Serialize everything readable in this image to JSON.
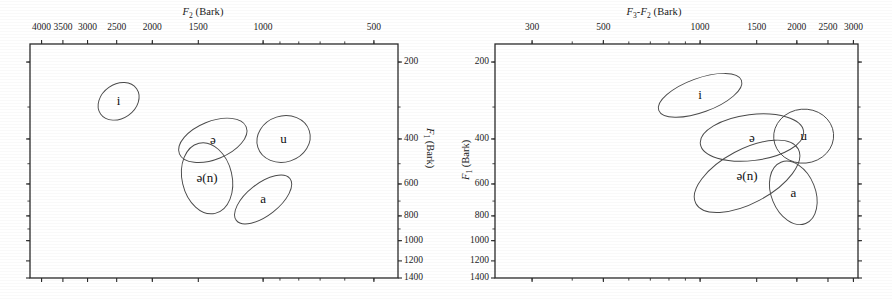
{
  "figure": {
    "panels": [
      {
        "id": "left",
        "xaxis": {
          "title_html": "F2 (Bark)",
          "label": "F2 (Bark)",
          "symbol": "F",
          "sub": "2",
          "unit": "(Bark)",
          "ticks": [
            4000,
            3500,
            3000,
            2500,
            2000,
            1500,
            1000,
            500
          ],
          "tick_labels": [
            "4000",
            "3500",
            "3000",
            "2500",
            "2000",
            "1500",
            "1000",
            "500"
          ],
          "scale": "log",
          "direction": "decreasing",
          "range": [
            4300,
            430
          ],
          "position": "top"
        },
        "yaxis": {
          "label": "F1 (Bark)",
          "symbol": "F",
          "sub": "1",
          "unit": "(Bark)",
          "ticks": [
            200,
            400,
            600,
            800,
            1000,
            1200,
            1400
          ],
          "tick_labels": [
            "200",
            "400",
            "600",
            "800",
            "1000",
            "1200",
            "1400"
          ],
          "scale": "log",
          "direction": "increasing-downward",
          "range": [
            170,
            1400
          ],
          "position": "right"
        }
      },
      {
        "id": "right",
        "xaxis": {
          "label": "F3-F2 (Bark)",
          "symbol": "F",
          "sub": "3",
          "sub2": "2",
          "unit": "(Bark)",
          "ticks": [
            300,
            500,
            1000,
            1500,
            2000,
            2500,
            3000
          ],
          "tick_labels": [
            "300",
            "500",
            "1000",
            "1500",
            "2000",
            "2500",
            "3000"
          ],
          "scale": "log",
          "direction": "increasing",
          "range": [
            230,
            3100
          ],
          "position": "top"
        },
        "yaxis": {
          "label": "F1 (Bark)",
          "symbol": "F",
          "sub": "1",
          "unit": "(Bark)",
          "ticks": [
            200,
            400,
            600,
            800,
            1000,
            1200,
            1400
          ],
          "tick_labels": [
            "200",
            "400",
            "600",
            "800",
            "1000",
            "1200",
            "1400"
          ],
          "scale": "log",
          "direction": "increasing-downward",
          "range": [
            170,
            1400
          ],
          "position": "left"
        }
      }
    ]
  },
  "chart_data": [
    {
      "type": "scatter",
      "id": "left-vowel-space",
      "title": "",
      "xlabel": "F2 (Bark)",
      "ylabel": "F1 (Bark)",
      "xlim": [
        4300,
        430
      ],
      "ylim": [
        170,
        1400
      ],
      "xscale": "log",
      "yscale": "log",
      "x_axis_position": "top",
      "y_axis_position": "right",
      "grid": false,
      "legend": "none",
      "marker": "ellipse-outline",
      "series": [
        {
          "name": "i",
          "label": "i",
          "cx": 2470,
          "cy": 285,
          "rx_px": 22,
          "ry_px": 17,
          "angle_deg": -35
        },
        {
          "name": "e",
          "label": "ə",
          "cx": 1370,
          "cy": 405,
          "rx_px": 36,
          "ry_px": 19,
          "angle_deg": -22
        },
        {
          "name": "u",
          "label": "u",
          "cx": 880,
          "cy": 400,
          "rx_px": 27,
          "ry_px": 23,
          "angle_deg": -18
        },
        {
          "name": "en",
          "label": "ə(n)",
          "cx": 1420,
          "cy": 570,
          "rx_px": 25,
          "ry_px": 36,
          "angle_deg": -13
        },
        {
          "name": "a",
          "label": "a",
          "cx": 1000,
          "cy": 690,
          "rx_px": 34,
          "ry_px": 16,
          "angle_deg": -38
        }
      ]
    },
    {
      "type": "scatter",
      "id": "right-vowel-space",
      "title": "",
      "xlabel": "F3-F2 (Bark)",
      "ylabel": "F1 (Bark)",
      "xlim": [
        230,
        3100
      ],
      "ylim": [
        170,
        1400
      ],
      "xscale": "log",
      "yscale": "log",
      "x_axis_position": "top",
      "y_axis_position": "left",
      "grid": false,
      "legend": "none",
      "marker": "ellipse-outline",
      "series": [
        {
          "name": "i",
          "label": "i",
          "cx": 1000,
          "cy": 270,
          "rx_px": 44,
          "ry_px": 17,
          "angle_deg": -20
        },
        {
          "name": "e",
          "label": "ə",
          "cx": 1450,
          "cy": 395,
          "rx_px": 52,
          "ry_px": 23,
          "angle_deg": -7
        },
        {
          "name": "u",
          "label": "u",
          "cx": 2100,
          "cy": 390,
          "rx_px": 30,
          "ry_px": 27,
          "angle_deg": -5
        },
        {
          "name": "en",
          "label": "ə(n)",
          "cx": 1400,
          "cy": 560,
          "rx_px": 58,
          "ry_px": 27,
          "angle_deg": -28
        },
        {
          "name": "a",
          "label": "a",
          "cx": 1950,
          "cy": 650,
          "rx_px": 22,
          "ry_px": 33,
          "angle_deg": -22
        }
      ]
    }
  ],
  "style": {
    "frame_color": "#2b2b2b",
    "ellipse_color": "#4a4a4a",
    "text_color": "#1a1a1a",
    "background": "#ffffff"
  }
}
